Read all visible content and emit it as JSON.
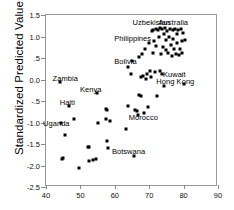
{
  "chart_data": {
    "type": "scatter",
    "title": "",
    "xlabel": "",
    "ylabel": "Standardized Predicted Value",
    "xlim": [
      40,
      90
    ],
    "ylim": [
      -2.5,
      1.5
    ],
    "xticks": [
      40,
      50,
      60,
      70,
      80,
      90
    ],
    "yticks": [
      1.5,
      1.0,
      0.5,
      0.0,
      -0.5,
      -1.0,
      -1.5,
      -2.0,
      -2.5
    ],
    "ytick_labels": [
      "1.5",
      "1.0",
      ".5",
      "0.0",
      "-.5",
      "-1.0",
      "-1.5",
      "-2.0",
      "-2.5"
    ],
    "xtick_labels": [
      "40",
      "50",
      "60",
      "70",
      "80",
      "90"
    ],
    "grid": false,
    "legend": "none",
    "marker": "filled-square",
    "marker_color": "#000000",
    "points": [
      {
        "x": 44.2,
        "y": -0.05
      },
      {
        "x": 44.4,
        "y": -1.0
      },
      {
        "x": 44.6,
        "y": -1.85
      },
      {
        "x": 44.8,
        "y": -1.82
      },
      {
        "x": 45.6,
        "y": -1.28
      },
      {
        "x": 46.6,
        "y": -0.62
      },
      {
        "x": 48.2,
        "y": -0.93
      },
      {
        "x": 49.6,
        "y": -2.05
      },
      {
        "x": 52.1,
        "y": -1.58
      },
      {
        "x": 52.6,
        "y": -1.57
      },
      {
        "x": 52.4,
        "y": -1.9
      },
      {
        "x": 53.6,
        "y": -1.88
      },
      {
        "x": 54.4,
        "y": -1.85
      },
      {
        "x": 54.9,
        "y": -0.31
      },
      {
        "x": 55.2,
        "y": -1.0
      },
      {
        "x": 57.3,
        "y": -0.68
      },
      {
        "x": 57.6,
        "y": -0.72
      },
      {
        "x": 57.5,
        "y": -0.93
      },
      {
        "x": 57.7,
        "y": -1.42
      },
      {
        "x": 57.9,
        "y": -1.6
      },
      {
        "x": 58.6,
        "y": -0.97
      },
      {
        "x": 63.3,
        "y": -1.15
      },
      {
        "x": 63.8,
        "y": -0.62
      },
      {
        "x": 63.9,
        "y": 0.3
      },
      {
        "x": 64.6,
        "y": 0.12
      },
      {
        "x": 65.1,
        "y": 0.42
      },
      {
        "x": 65.6,
        "y": -1.78
      },
      {
        "x": 66.0,
        "y": -0.72
      },
      {
        "x": 66.5,
        "y": -0.74
      },
      {
        "x": 66.8,
        "y": -0.83
      },
      {
        "x": 66.9,
        "y": 0.52
      },
      {
        "x": 67.0,
        "y": -0.36
      },
      {
        "x": 67.5,
        "y": -0.38
      },
      {
        "x": 67.6,
        "y": 0.05
      },
      {
        "x": 67.9,
        "y": 0.6
      },
      {
        "x": 68.2,
        "y": 0.08
      },
      {
        "x": 68.6,
        "y": -0.78
      },
      {
        "x": 68.8,
        "y": 0.72
      },
      {
        "x": 69.1,
        "y": 0.02
      },
      {
        "x": 69.3,
        "y": 0.12
      },
      {
        "x": 69.6,
        "y": -0.65
      },
      {
        "x": 69.9,
        "y": 0.85
      },
      {
        "x": 70.2,
        "y": 0.2
      },
      {
        "x": 70.5,
        "y": 0.05
      },
      {
        "x": 70.8,
        "y": 1.12
      },
      {
        "x": 71.0,
        "y": 1.15
      },
      {
        "x": 71.2,
        "y": 0.62
      },
      {
        "x": 71.5,
        "y": 0.9
      },
      {
        "x": 71.6,
        "y": 0.18
      },
      {
        "x": 71.9,
        "y": 1.18
      },
      {
        "x": 72.1,
        "y": 0.78
      },
      {
        "x": 72.3,
        "y": -0.38
      },
      {
        "x": 72.5,
        "y": 1.16
      },
      {
        "x": 72.8,
        "y": 0.98
      },
      {
        "x": 73.0,
        "y": 0.2
      },
      {
        "x": 73.2,
        "y": 1.2
      },
      {
        "x": 73.4,
        "y": 0.6
      },
      {
        "x": 73.6,
        "y": 0.12
      },
      {
        "x": 73.8,
        "y": 1.17
      },
      {
        "x": 74.0,
        "y": 0.75
      },
      {
        "x": 74.2,
        "y": -0.16
      },
      {
        "x": 74.4,
        "y": 1.05
      },
      {
        "x": 74.6,
        "y": 1.2
      },
      {
        "x": 74.8,
        "y": 0.68
      },
      {
        "x": 75.0,
        "y": 0.92
      },
      {
        "x": 75.3,
        "y": 1.12
      },
      {
        "x": 75.6,
        "y": 0.62
      },
      {
        "x": 75.8,
        "y": 1.0
      },
      {
        "x": 76.0,
        "y": 1.18
      },
      {
        "x": 76.3,
        "y": 0.8
      },
      {
        "x": 76.5,
        "y": 0.55
      },
      {
        "x": 76.8,
        "y": 1.15
      },
      {
        "x": 77.0,
        "y": 0.95
      },
      {
        "x": 77.2,
        "y": 0.7
      },
      {
        "x": 77.5,
        "y": 1.18
      },
      {
        "x": 77.8,
        "y": 0.6
      },
      {
        "x": 78.0,
        "y": 1.05
      },
      {
        "x": 78.2,
        "y": 0.85
      },
      {
        "x": 78.5,
        "y": 1.15
      },
      {
        "x": 78.6,
        "y": 0.58
      },
      {
        "x": 78.9,
        "y": 0.72
      },
      {
        "x": 79.2,
        "y": 1.18
      },
      {
        "x": 79.4,
        "y": 0.62
      },
      {
        "x": 79.6,
        "y": 0.9
      },
      {
        "x": 79.8,
        "y": 1.08
      },
      {
        "x": 80.1,
        "y": -0.1
      },
      {
        "x": 80.3,
        "y": 0.92
      }
    ],
    "annotations": [
      {
        "label": "Uzbekistan",
        "x": 70.6,
        "y": 1.33
      },
      {
        "label": "Australia",
        "x": 77.0,
        "y": 1.33
      },
      {
        "label": "Philippines",
        "x": 65.2,
        "y": 0.97
      },
      {
        "label": "Bolivia",
        "x": 63.1,
        "y": 0.42
      },
      {
        "label": "Kuwait",
        "x": 77.3,
        "y": 0.13
      },
      {
        "label": "Hong Kong",
        "x": 77.6,
        "y": -0.03
      },
      {
        "label": "Zambia",
        "x": 45.6,
        "y": 0.03
      },
      {
        "label": "Kenya",
        "x": 53.0,
        "y": -0.21
      },
      {
        "label": "Haiti",
        "x": 46.2,
        "y": -0.52
      },
      {
        "label": "Uganda",
        "x": 43.0,
        "y": -1.0
      },
      {
        "label": "Morocco",
        "x": 68.3,
        "y": -0.88
      },
      {
        "label": "Botswana",
        "x": 64.0,
        "y": -1.66
      }
    ]
  }
}
